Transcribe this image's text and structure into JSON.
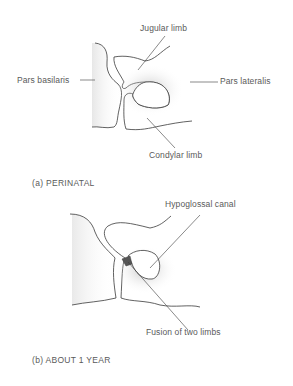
{
  "panels": [
    {
      "caption": "(a)  PERINATAL",
      "labels": {
        "jugular_limb": "Jugular limb",
        "pars_basilaris": "Pars basilaris",
        "pars_lateralis": "Pars lateralis",
        "condylar_limb": "Condylar limb"
      }
    },
    {
      "caption": "(b)  ABOUT 1 YEAR",
      "labels": {
        "hypoglossal_canal": "Hypoglossal canal",
        "fusion_of_two_limbs": "Fusion of two limbs"
      }
    }
  ],
  "colors": {
    "line": "#3a3a3a",
    "shade": "#b0b0b0",
    "text": "#5a5a5a"
  }
}
